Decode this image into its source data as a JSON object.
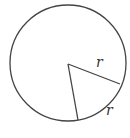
{
  "diagram": {
    "type": "circle-sector",
    "circle": {
      "cx": 68,
      "cy": 63,
      "r": 58,
      "stroke": "#444444"
    },
    "center": [
      68,
      64
    ],
    "radius_endpoints": [
      [
        120,
        84
      ],
      [
        78,
        120
      ]
    ],
    "labels": {
      "radius": "r",
      "arc": "r"
    }
  }
}
